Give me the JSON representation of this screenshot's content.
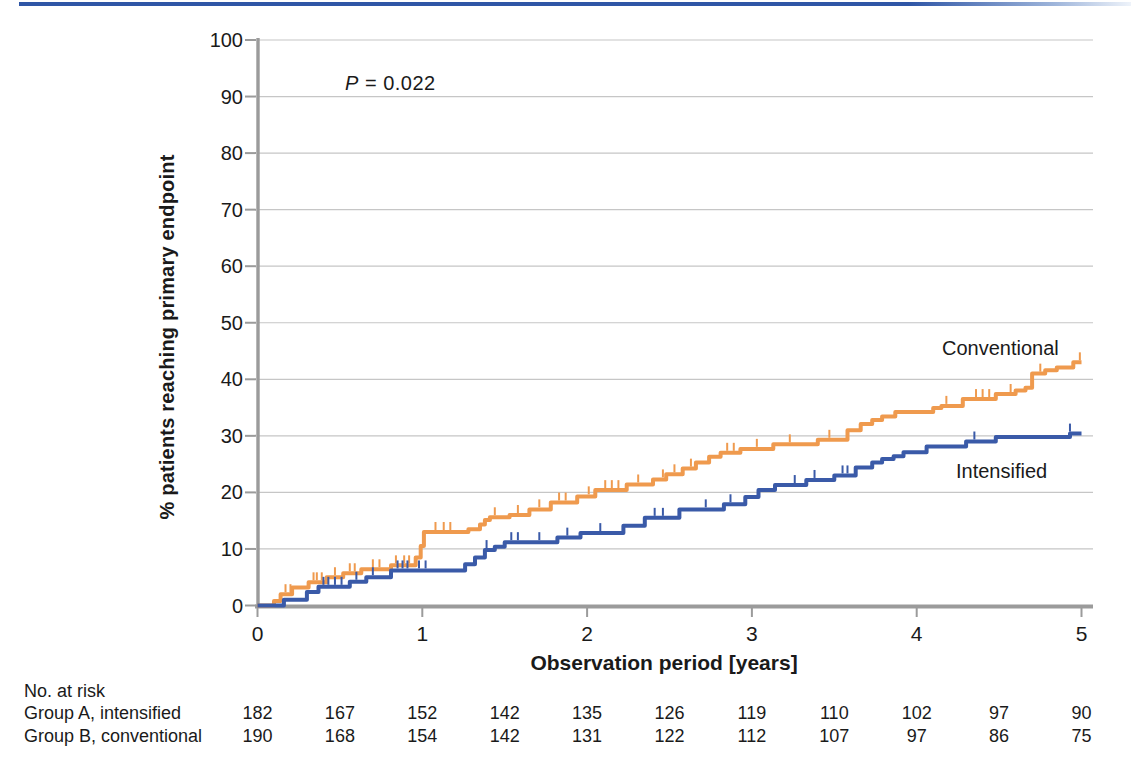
{
  "colors": {
    "top_rule": "#2f56a6",
    "conventional": "#ef9a4e",
    "intensified": "#3a5aa8",
    "axis": "#9b9b9b",
    "grid": "#c6c6c6",
    "text": "#1a1a1a"
  },
  "annotations": {
    "p_label": "P",
    "p_rest": " = 0.022"
  },
  "chart_data": {
    "type": "line",
    "subtype": "kaplan-meier-step",
    "title": "",
    "xlabel": "Observation period [years]",
    "ylabel": "% patients reaching primary endpoint",
    "xlim": [
      0,
      5
    ],
    "ylim": [
      0,
      100
    ],
    "x_ticks": [
      0,
      1,
      2,
      3,
      4,
      5
    ],
    "y_ticks": [
      0,
      10,
      20,
      30,
      40,
      50,
      60,
      70,
      80,
      90,
      100
    ],
    "grid": "horizontal",
    "legend_position": "inline-right",
    "p_value": "P = 0.022",
    "series": [
      {
        "name": "Conventional",
        "color": "#ef9a4e",
        "steps": [
          [
            0,
            0
          ],
          [
            0.1,
            0.8
          ],
          [
            0.14,
            2.0
          ],
          [
            0.21,
            3.2
          ],
          [
            0.31,
            4.1
          ],
          [
            0.42,
            5.0
          ],
          [
            0.52,
            5.7
          ],
          [
            0.63,
            6.4
          ],
          [
            0.81,
            7.1
          ],
          [
            0.96,
            8.5
          ],
          [
            0.99,
            10.5
          ],
          [
            1.01,
            13.0
          ],
          [
            1.28,
            13.5
          ],
          [
            1.35,
            14.3
          ],
          [
            1.38,
            15.1
          ],
          [
            1.41,
            15.6
          ],
          [
            1.53,
            16.0
          ],
          [
            1.65,
            17.0
          ],
          [
            1.78,
            18.2
          ],
          [
            1.94,
            19.3
          ],
          [
            2.05,
            20.4
          ],
          [
            2.24,
            21.4
          ],
          [
            2.4,
            22.3
          ],
          [
            2.48,
            23.2
          ],
          [
            2.58,
            24.2
          ],
          [
            2.66,
            25.3
          ],
          [
            2.74,
            26.3
          ],
          [
            2.81,
            27.0
          ],
          [
            2.93,
            27.7
          ],
          [
            3.13,
            28.5
          ],
          [
            3.4,
            29.3
          ],
          [
            3.58,
            31.0
          ],
          [
            3.66,
            32.1
          ],
          [
            3.73,
            32.8
          ],
          [
            3.79,
            33.4
          ],
          [
            3.87,
            34.2
          ],
          [
            4.1,
            34.9
          ],
          [
            4.15,
            35.3
          ],
          [
            4.28,
            36.5
          ],
          [
            4.48,
            37.4
          ],
          [
            4.6,
            38.0
          ],
          [
            4.66,
            38.5
          ],
          [
            4.7,
            41.0
          ],
          [
            4.78,
            41.6
          ],
          [
            4.85,
            42.1
          ],
          [
            4.95,
            43.0
          ],
          [
            5.0,
            43.0
          ]
        ],
        "censor_ticks": [
          0.17,
          0.2,
          0.34,
          0.36,
          0.39,
          0.47,
          0.56,
          0.59,
          0.7,
          0.74,
          0.84,
          0.89,
          0.92,
          1.08,
          1.13,
          1.17,
          1.44,
          1.58,
          1.71,
          1.83,
          1.87,
          2.01,
          2.11,
          2.15,
          2.19,
          2.31,
          2.46,
          2.53,
          2.63,
          2.85,
          2.89,
          3.03,
          3.23,
          3.47,
          4.18,
          4.36,
          4.4,
          4.44,
          4.57,
          4.75,
          4.99
        ]
      },
      {
        "name": "Intensified",
        "color": "#3a5aa8",
        "steps": [
          [
            0,
            0
          ],
          [
            0.16,
            1.0
          ],
          [
            0.3,
            2.4
          ],
          [
            0.37,
            3.3
          ],
          [
            0.56,
            4.2
          ],
          [
            0.66,
            5.0
          ],
          [
            0.81,
            6.2
          ],
          [
            1.26,
            7.3
          ],
          [
            1.32,
            8.5
          ],
          [
            1.38,
            9.8
          ],
          [
            1.44,
            10.4
          ],
          [
            1.5,
            11.2
          ],
          [
            1.82,
            12.0
          ],
          [
            1.96,
            12.8
          ],
          [
            2.22,
            14.1
          ],
          [
            2.35,
            15.5
          ],
          [
            2.56,
            17.0
          ],
          [
            2.83,
            17.9
          ],
          [
            2.96,
            19.2
          ],
          [
            3.04,
            20.4
          ],
          [
            3.14,
            21.3
          ],
          [
            3.33,
            22.2
          ],
          [
            3.5,
            23.0
          ],
          [
            3.63,
            24.4
          ],
          [
            3.73,
            25.3
          ],
          [
            3.79,
            25.9
          ],
          [
            3.86,
            26.4
          ],
          [
            3.92,
            27.1
          ],
          [
            4.06,
            28.1
          ],
          [
            4.3,
            29.0
          ],
          [
            4.48,
            29.8
          ],
          [
            4.93,
            30.4
          ],
          [
            5.0,
            30.4
          ]
        ],
        "censor_ticks": [
          0.4,
          0.43,
          0.47,
          0.51,
          0.6,
          0.7,
          0.85,
          0.88,
          0.91,
          0.98,
          1.02,
          1.39,
          1.54,
          1.58,
          1.71,
          1.88,
          2.08,
          2.41,
          2.46,
          2.72,
          2.87,
          3.26,
          3.38,
          3.55,
          3.58,
          4.35,
          4.93
        ]
      }
    ]
  },
  "risk_table": {
    "title": "No. at risk",
    "time_points": [
      0,
      0.5,
      1,
      1.5,
      2,
      2.5,
      3,
      3.5,
      4,
      4.5,
      5
    ],
    "rows": [
      {
        "label": "Group A, intensified",
        "counts": [
          182,
          167,
          152,
          142,
          135,
          126,
          119,
          110,
          102,
          97,
          90
        ]
      },
      {
        "label": "Group B, conventional",
        "counts": [
          190,
          168,
          154,
          142,
          131,
          122,
          112,
          107,
          97,
          86,
          75
        ]
      }
    ]
  }
}
